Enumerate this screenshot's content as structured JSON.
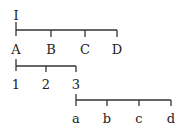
{
  "diagram": {
    "top_label": "I",
    "rows": [
      {
        "labels": [
          "A",
          "B",
          "C",
          "D"
        ]
      },
      {
        "labels": [
          "1",
          "2",
          "3"
        ]
      },
      {
        "labels": [
          "a",
          "b",
          "c",
          "d"
        ]
      }
    ]
  },
  "colors": {
    "line": "#333333",
    "text": "#222222",
    "background": "#ffffff"
  }
}
